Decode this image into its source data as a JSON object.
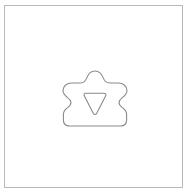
{
  "canvas": {
    "width": 188,
    "height": 196,
    "background_color": "#ffffff",
    "description": "line-drawing of a rounded crown-like outer outline enclosing a downward-pointing rounded triangle"
  },
  "frame": {
    "name": "canvas-border",
    "x": 4,
    "y": 5,
    "width": 179,
    "height": 183,
    "stroke_color": "#b9b9b9",
    "stroke_width": 1,
    "fill": "none"
  },
  "shapes": {
    "outer": {
      "label": "rounded-crown-outline",
      "stroke_color": "#8a8a8a",
      "stroke_width": 1.1,
      "fill": "none",
      "bounds": {
        "x": 63,
        "y": 71,
        "width": 64,
        "height": 55
      },
      "center": {
        "x": 95,
        "y": 98
      },
      "path": "M 95 71 C 99.5 71 101.8 74.2 103.0 77.4 C 104.4 81.2 106.4 83.0 109.6 83.0 L 118.0 83.0 C 123.6 83.0 127.0 86.4 127.0 90.6 C 127.0 94.0 124.6 96.0 122.4 97.6 C 120.2 99.2 119.0 100.6 119.0 102.6 C 119.0 104.8 120.4 106.2 122.4 107.6 C 124.8 109.2 126.6 111.0 126.6 114.6 L 126.6 120.0 C 126.6 123.6 124.2 126.0 120.4 126.0 L 69.6 126.0 C 65.8 126.0 63.4 123.6 63.4 120.0 L 63.4 114.6 C 63.4 111.0 65.2 109.2 67.6 107.6 C 69.6 106.2 71.0 104.8 71.0 102.6 C 71.0 100.6 69.8 99.2 67.6 97.6 C 65.4 96.0 63.0 94.0 63.0 90.6 C 63.0 86.4 66.4 83.0 72.0 83.0 L 80.4 83.0 C 83.6 83.0 85.6 81.2 87.0 77.4 C 88.2 74.2 90.5 71 95 71 Z"
    },
    "inner": {
      "label": "downward-triangle-rounded",
      "stroke_color": "#8a8a8a",
      "stroke_width": 1.1,
      "fill": "none",
      "bounds": {
        "x": 83,
        "y": 93,
        "width": 23,
        "height": 22
      },
      "orientation": "point-down",
      "corner_radius": 2.5,
      "path": "M 85.2 93.2 L 103.8 93.2 C 105.6 93.2 106.4 94.6 105.6 96.1 L 96.6 113.4 C 95.8 114.9 94.2 114.9 93.4 113.4 L 84.4 96.1 C 83.6 94.6 84.4 93.2 85.2 93.2 Z"
    }
  }
}
